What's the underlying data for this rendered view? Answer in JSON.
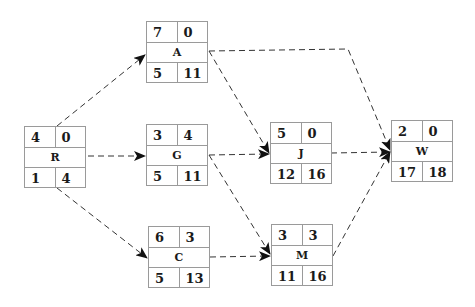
{
  "diagram": {
    "type": "activity-on-node network",
    "nodes": [
      {
        "id": "R",
        "label": "R",
        "top_left": "4",
        "top_right": "0",
        "bottom_left": "1",
        "bottom_right": "4",
        "x": 24,
        "y": 126
      },
      {
        "id": "A",
        "label": "A",
        "top_left": "7",
        "top_right": "0",
        "bottom_left": "5",
        "bottom_right": "11",
        "x": 146,
        "y": 21
      },
      {
        "id": "G",
        "label": "G",
        "top_left": "3",
        "top_right": "4",
        "bottom_left": "5",
        "bottom_right": "11",
        "x": 146,
        "y": 124
      },
      {
        "id": "C",
        "label": "C",
        "top_left": "6",
        "top_right": "3",
        "bottom_left": "5",
        "bottom_right": "13",
        "x": 148,
        "y": 226
      },
      {
        "id": "J",
        "label": "J",
        "top_left": "5",
        "top_right": "0",
        "bottom_left": "12",
        "bottom_right": "16",
        "x": 270,
        "y": 122
      },
      {
        "id": "M",
        "label": "M",
        "top_left": "3",
        "top_right": "3",
        "bottom_left": "11",
        "bottom_right": "16",
        "x": 271,
        "y": 224
      },
      {
        "id": "W",
        "label": "W",
        "top_left": "2",
        "top_right": "0",
        "bottom_left": "17",
        "bottom_right": "18",
        "x": 391,
        "y": 120
      }
    ],
    "edges": [
      {
        "from": "R",
        "to": "A"
      },
      {
        "from": "R",
        "to": "G"
      },
      {
        "from": "R",
        "to": "C"
      },
      {
        "from": "A",
        "to": "W"
      },
      {
        "from": "A",
        "to": "J"
      },
      {
        "from": "G",
        "to": "J"
      },
      {
        "from": "G",
        "to": "M"
      },
      {
        "from": "C",
        "to": "M"
      },
      {
        "from": "J",
        "to": "W"
      },
      {
        "from": "M",
        "to": "W"
      }
    ],
    "colors": {
      "border": "#9a9a9a",
      "text": "#1a1a1a",
      "edge": "#333333"
    }
  }
}
